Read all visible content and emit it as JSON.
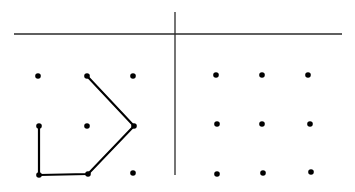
{
  "diagram": {
    "background": "#ffffff",
    "ink_color": "#000000",
    "rule_color": "#2a2a2a",
    "divider_horizontal": {
      "x1": 14,
      "y1": 34,
      "x2": 342,
      "y2": 34
    },
    "divider_vertical": {
      "x1": 175,
      "y1": 12,
      "x2": 175,
      "y2": 175
    },
    "left_grid": {
      "dots": [
        {
          "row": 0,
          "col": 0,
          "x": 38,
          "y": 76
        },
        {
          "row": 0,
          "col": 1,
          "x": 87,
          "y": 76
        },
        {
          "row": 0,
          "col": 2,
          "x": 133,
          "y": 76
        },
        {
          "row": 1,
          "col": 0,
          "x": 39,
          "y": 126
        },
        {
          "row": 1,
          "col": 1,
          "x": 87,
          "y": 126
        },
        {
          "row": 1,
          "col": 2,
          "x": 134,
          "y": 126
        },
        {
          "row": 2,
          "col": 0,
          "x": 39,
          "y": 175
        },
        {
          "row": 2,
          "col": 1,
          "x": 88,
          "y": 174
        },
        {
          "row": 2,
          "col": 2,
          "x": 133,
          "y": 173
        }
      ],
      "path": [
        {
          "x": 87,
          "y": 76
        },
        {
          "x": 134,
          "y": 126
        },
        {
          "x": 88,
          "y": 174
        },
        {
          "x": 39,
          "y": 175
        },
        {
          "x": 39,
          "y": 126
        }
      ]
    },
    "right_grid": {
      "dots": [
        {
          "row": 0,
          "col": 0,
          "x": 216,
          "y": 75
        },
        {
          "row": 0,
          "col": 1,
          "x": 262,
          "y": 75
        },
        {
          "row": 0,
          "col": 2,
          "x": 308,
          "y": 75
        },
        {
          "row": 1,
          "col": 0,
          "x": 217,
          "y": 124
        },
        {
          "row": 1,
          "col": 1,
          "x": 262,
          "y": 124
        },
        {
          "row": 1,
          "col": 2,
          "x": 310,
          "y": 124
        },
        {
          "row": 2,
          "col": 0,
          "x": 217,
          "y": 174
        },
        {
          "row": 2,
          "col": 1,
          "x": 263,
          "y": 173
        },
        {
          "row": 2,
          "col": 2,
          "x": 311,
          "y": 172
        }
      ]
    }
  }
}
